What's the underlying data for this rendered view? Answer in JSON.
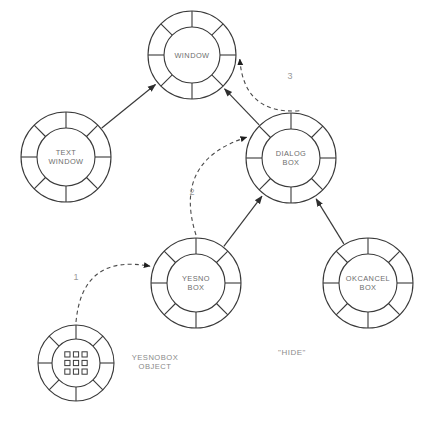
{
  "diagram": {
    "background_color": "#ffffff",
    "stroke_color": "#3a3a3a",
    "label_color": "#6d6d6d",
    "nodes": [
      {
        "id": "window",
        "label_lines": [
          "WINDOW"
        ],
        "cx": 192,
        "cy": 55,
        "r_outer": 44,
        "r_inner": 28,
        "kind": "class",
        "segments": 8
      },
      {
        "id": "text-window",
        "label_lines": [
          "TEXT",
          "WINDOW"
        ],
        "cx": 66,
        "cy": 157,
        "r_outer": 45,
        "r_inner": 29,
        "kind": "class",
        "segments": 8
      },
      {
        "id": "dialog-box",
        "label_lines": [
          "DIALOG",
          "BOX"
        ],
        "cx": 291,
        "cy": 158,
        "r_outer": 45,
        "r_inner": 29,
        "kind": "class",
        "segments": 8
      },
      {
        "id": "yesno-box",
        "label_lines": [
          "YESNO",
          "BOX"
        ],
        "cx": 196,
        "cy": 283,
        "r_outer": 45,
        "r_inner": 29,
        "kind": "class",
        "segments": 8
      },
      {
        "id": "okcancel-box",
        "label_lines": [
          "OKCANCEL",
          "BOX"
        ],
        "cx": 368,
        "cy": 283,
        "r_outer": 45,
        "r_inner": 29,
        "kind": "class",
        "segments": 8
      },
      {
        "id": "yesnobox-object",
        "label_lines": [],
        "cx": 76,
        "cy": 363,
        "r_outer": 38,
        "r_inner": 24,
        "kind": "instance",
        "segments": 8,
        "grid_rows": 3,
        "grid_cols": 3
      }
    ],
    "external_labels": [
      {
        "id": "yesnobox-object-label",
        "lines": [
          "YESNOBOX",
          "OBJECT"
        ],
        "x": 155,
        "y": 362
      }
    ],
    "annotations": [
      {
        "id": "hide-annotation",
        "text": "\"HIDE\"",
        "x": 292,
        "y": 352
      }
    ],
    "inheritance_edges": [
      {
        "id": "text-window-to-window",
        "from": "text-window",
        "to": "window"
      },
      {
        "id": "dialog-box-to-window",
        "from": "dialog-box",
        "to": "window"
      },
      {
        "id": "yesno-box-to-dialog-box",
        "from": "yesno-box",
        "to": "dialog-box"
      },
      {
        "id": "okcancel-box-to-dialog-box",
        "from": "okcancel-box",
        "to": "dialog-box"
      }
    ],
    "message_edges": [
      {
        "id": "message-1",
        "number": "1",
        "from": "yesnobox-object",
        "to": "yesno-box",
        "number_x": 76,
        "number_y": 277
      },
      {
        "id": "message-2",
        "number": "2",
        "from": "yesno-box",
        "to": "dialog-box",
        "number_x": 192,
        "number_y": 192
      },
      {
        "id": "message-3",
        "number": "3",
        "from": "dialog-box",
        "to": "window",
        "number_x": 290,
        "number_y": 76
      }
    ]
  }
}
